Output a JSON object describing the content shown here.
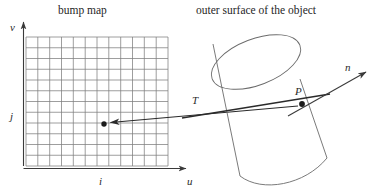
{
  "figure": {
    "title_left": "bump map",
    "title_right": "outer surface of the object",
    "labels": {
      "v_axis": "v",
      "u_axis": "u",
      "i_axis": "i",
      "j_axis": "j",
      "tangent": "T",
      "point": "P",
      "normal": "n"
    },
    "colors": {
      "stroke": "#3a3a3a",
      "grid": "#7d7d7d",
      "text": "#2a2a2a",
      "background": "#ffffff"
    },
    "grid": {
      "cols": 12,
      "rows": 12,
      "x0": 26,
      "y0": 37,
      "x1": 168,
      "y1": 166
    },
    "markers": {
      "texel_point": {
        "x": 104,
        "y": 124
      },
      "surface_point": {
        "x": 302,
        "y": 104
      }
    }
  }
}
